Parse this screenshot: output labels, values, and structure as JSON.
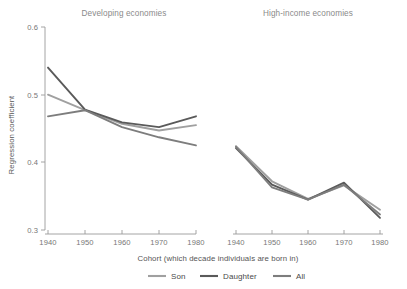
{
  "figure": {
    "y_axis_label": "Regression coefficient",
    "x_axis_label": "Cohort (which decade individuals are born in)"
  },
  "legend": {
    "position": "bottom-center",
    "items": [
      {
        "label": "Son",
        "color": "#a0a0a0"
      },
      {
        "label": "Daughter",
        "color": "#5a5a5a"
      },
      {
        "label": "All",
        "color": "#7d7d7d"
      }
    ]
  },
  "chart_data": [
    {
      "type": "line",
      "title": "Developing economies",
      "xlabel": "Cohort (which decade individuals are born in)",
      "ylabel": "Regression coefficient",
      "x": [
        1940,
        1950,
        1960,
        1970,
        1980
      ],
      "xtick_labels": [
        "1940",
        "1950",
        "1960",
        "1970",
        "1980"
      ],
      "ytick_labels": [
        "0.3",
        "0.4",
        "0.5",
        "0.6"
      ],
      "yticks": [
        0.3,
        0.4,
        0.5,
        0.6
      ],
      "xlim": [
        1940,
        1980
      ],
      "ylim": [
        0.3,
        0.6
      ],
      "grid": false,
      "series": [
        {
          "name": "Son",
          "color": "#a0a0a0",
          "values": [
            0.5,
            0.477,
            0.457,
            0.447,
            0.455
          ]
        },
        {
          "name": "Daughter",
          "color": "#5a5a5a",
          "values": [
            0.54,
            0.478,
            0.459,
            0.452,
            0.468
          ]
        },
        {
          "name": "All",
          "color": "#7d7d7d",
          "values": [
            0.468,
            0.477,
            0.452,
            0.437,
            0.425
          ]
        }
      ]
    },
    {
      "type": "line",
      "title": "High-income economies",
      "xlabel": "Cohort (which decade individuals are born in)",
      "ylabel": "Regression coefficient",
      "x": [
        1940,
        1950,
        1960,
        1970,
        1980
      ],
      "xtick_labels": [
        "1940",
        "1950",
        "1960",
        "1970",
        "1980"
      ],
      "ytick_labels": [
        "0.3",
        "0.4",
        "0.5",
        "0.6"
      ],
      "yticks": [
        0.3,
        0.4,
        0.5,
        0.6
      ],
      "xlim": [
        1940,
        1980
      ],
      "ylim": [
        0.3,
        0.6
      ],
      "grid": false,
      "series": [
        {
          "name": "Son",
          "color": "#a0a0a0",
          "values": [
            0.424,
            0.372,
            0.346,
            0.366,
            0.33
          ]
        },
        {
          "name": "Daughter",
          "color": "#5a5a5a",
          "values": [
            0.421,
            0.367,
            0.345,
            0.37,
            0.318
          ]
        },
        {
          "name": "All",
          "color": "#7d7d7d",
          "values": [
            0.423,
            0.363,
            0.345,
            0.367,
            0.323
          ]
        }
      ]
    }
  ]
}
